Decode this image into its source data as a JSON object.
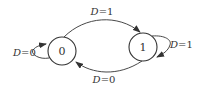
{
  "diagram": {
    "type": "state-transition",
    "states": [
      {
        "id": "s0",
        "label": "0"
      },
      {
        "id": "s1",
        "label": "1"
      }
    ],
    "transitions": [
      {
        "from": "0",
        "to": "1",
        "var": "D",
        "eq": "=1"
      },
      {
        "from": "1",
        "to": "0",
        "var": "D",
        "eq": "=0"
      },
      {
        "from": "0",
        "to": "0",
        "var": "D",
        "eq": "=0"
      },
      {
        "from": "1",
        "to": "1",
        "var": "D",
        "eq": "=1"
      }
    ],
    "colors": {
      "stroke": "#333333",
      "background": "#ffffff"
    }
  }
}
